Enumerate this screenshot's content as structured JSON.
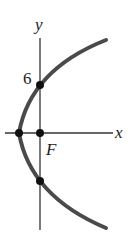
{
  "diagram": {
    "type": "parabola-graph",
    "axes": {
      "x_label": "x",
      "y_label": "y"
    },
    "labels": {
      "y_intercept_value": "6",
      "focus_label": "F"
    },
    "curve": {
      "description": "Parabola opening to the right with vertex left of origin, focus at origin",
      "color": "#4a4a4a"
    },
    "points": [
      {
        "name": "vertex",
        "on": "x-axis"
      },
      {
        "name": "focus",
        "label": "F",
        "at": "origin"
      },
      {
        "name": "upper-y-intercept",
        "value": "6"
      },
      {
        "name": "lower-y-intercept"
      }
    ],
    "colors": {
      "axis": "#333333",
      "curve": "#4a4a4a",
      "point": "#111111"
    }
  }
}
